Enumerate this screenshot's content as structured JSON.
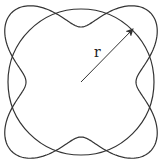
{
  "diagram": {
    "center": {
      "x": 81,
      "y": 82
    },
    "circle_radius": 73,
    "curve": {
      "base_radius": 76.5,
      "amplitude": 21.5,
      "lobes": 4,
      "phase_deg": 45
    },
    "arrow": {
      "from": [
        81,
        82
      ],
      "to": [
        133,
        29
      ]
    },
    "radius_label": "r",
    "stroke_color": "#333333"
  }
}
